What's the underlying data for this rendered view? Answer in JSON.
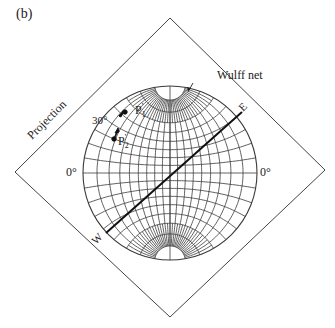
{
  "figure": {
    "panel_label": "(b)",
    "net_label": "Wulff net",
    "projection_label": "Projection",
    "left_angle_label": "0°",
    "right_angle_label": "0°",
    "angle_label": "30°",
    "point1_label": "P",
    "point1_sub": "1",
    "point1_prime": "'",
    "point2_label": "P",
    "point2_sub": "2",
    "point2_prime": "'",
    "west_label": "W",
    "east_label": "E"
  },
  "colors": {
    "line": "#333333",
    "grid": "#3a3a3a",
    "background": "#ffffff"
  }
}
